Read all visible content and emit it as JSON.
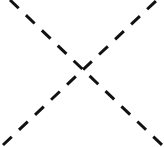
{
  "canvas": {
    "width": 164,
    "height": 147,
    "background_color": "#ffffff"
  },
  "figure": {
    "name": "dashed-x-cross",
    "stroke_color": "#111111",
    "stroke_width": 3,
    "dash_length": 12,
    "gap_length": 10,
    "line_cap": "butt",
    "crossing_point": {
      "x": 82,
      "y": 73
    }
  },
  "lines": [
    {
      "name": "diagonal-down-right",
      "label": "top-left to bottom-right",
      "x1": 10,
      "y1": 0,
      "x2": 162,
      "y2": 145,
      "stroke_color": "#111111",
      "stroke_width": 3,
      "dash_array": "12 10"
    },
    {
      "name": "diagonal-up-right",
      "label": "bottom-left to top-right",
      "x1": 3,
      "y1": 145,
      "x2": 157,
      "y2": 0,
      "stroke_color": "#111111",
      "stroke_width": 3,
      "dash_array": "12 10"
    }
  ]
}
